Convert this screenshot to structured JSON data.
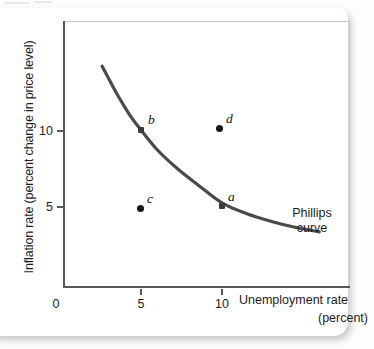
{
  "chart_data": {
    "type": "line",
    "title": "",
    "xlabel": "Unemployment rate",
    "xunit": "(percent)",
    "ylabel": "Inflation rate (percent change in price level)",
    "xticks": [
      "0",
      "5",
      "10"
    ],
    "xtick_values": [
      0,
      5,
      10
    ],
    "yticks": [
      "10",
      "5"
    ],
    "ytick_values": [
      10,
      5
    ],
    "xlim": [
      0,
      17
    ],
    "ylim": [
      0,
      17
    ],
    "grid": false,
    "legend": "none",
    "series": [
      {
        "name": "Phillips curve",
        "label": "Phillips\ncurve",
        "label_line1": "Phillips",
        "label_line2": "curve",
        "color": "#4a4a4c",
        "x": [
          2.6,
          3.5,
          4.3,
          5.0,
          6.0,
          7.2,
          8.5,
          10.0,
          11.5,
          13.0,
          14.5,
          16.0
        ],
        "y": [
          14.2,
          12.4,
          11.0,
          10.0,
          8.7,
          7.5,
          6.4,
          5.2,
          4.5,
          4.0,
          3.6,
          3.3
        ]
      }
    ],
    "points": [
      {
        "id": "a",
        "label": "a",
        "x": 10,
        "y": 5.2,
        "on_curve": true,
        "marker": "square"
      },
      {
        "id": "b",
        "label": "b",
        "x": 5,
        "y": 10,
        "on_curve": true,
        "marker": "square"
      },
      {
        "id": "c",
        "label": "c",
        "x": 5,
        "y": 5.1,
        "on_curve": false,
        "marker": "circle"
      },
      {
        "id": "d",
        "label": "d",
        "x": 10,
        "y": 10.1,
        "on_curve": false,
        "marker": "circle"
      }
    ],
    "annotations": [
      {
        "text": "Phillips curve",
        "x": 14.2,
        "y": 6.5
      }
    ]
  },
  "axes": {
    "y_label": "Inflation rate (percent change in price level)",
    "y_tick_10": "10",
    "y_tick_5": "5",
    "x_tick_0": "0",
    "x_tick_5": "5",
    "x_tick_10": "10",
    "x_title": "Unemployment rate",
    "x_unit": "(percent)"
  },
  "curve": {
    "name_line1": "Phillips",
    "name_line2": "curve"
  },
  "points": {
    "a": "a",
    "b": "b",
    "c": "c",
    "d": "d"
  },
  "colors": {
    "curve": "#4a4a4c",
    "axis": "#59595b",
    "marker": "#161616",
    "text": "#1d1d1d",
    "card": "#ffffff",
    "background": "#fdfdfd"
  }
}
